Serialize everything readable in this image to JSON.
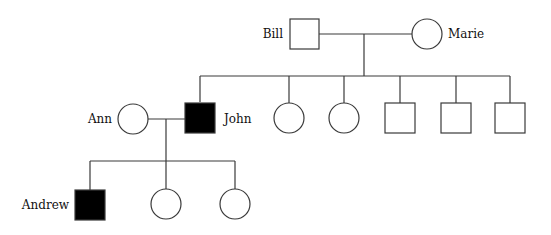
{
  "diagram": {
    "type": "pedigree",
    "individuals": [
      {
        "id": "bill",
        "name": "Bill",
        "sex": "male",
        "affected": false,
        "generation": 1
      },
      {
        "id": "marie",
        "name": "Marie",
        "sex": "female",
        "affected": false,
        "generation": 1
      },
      {
        "id": "ann",
        "name": "Ann",
        "sex": "female",
        "affected": false,
        "generation": 2
      },
      {
        "id": "john",
        "name": "John",
        "sex": "male",
        "affected": true,
        "generation": 2
      },
      {
        "id": "sib2",
        "name": "",
        "sex": "female",
        "affected": false,
        "generation": 2
      },
      {
        "id": "sib3",
        "name": "",
        "sex": "female",
        "affected": false,
        "generation": 2
      },
      {
        "id": "sib4",
        "name": "",
        "sex": "male",
        "affected": false,
        "generation": 2
      },
      {
        "id": "sib5",
        "name": "",
        "sex": "male",
        "affected": false,
        "generation": 2
      },
      {
        "id": "sib6",
        "name": "",
        "sex": "male",
        "affected": false,
        "generation": 2
      },
      {
        "id": "andrew",
        "name": "Andrew",
        "sex": "male",
        "affected": true,
        "generation": 3
      },
      {
        "id": "child2",
        "name": "",
        "sex": "female",
        "affected": false,
        "generation": 3
      },
      {
        "id": "child3",
        "name": "",
        "sex": "female",
        "affected": false,
        "generation": 3
      }
    ],
    "labels": {
      "bill": "Bill",
      "marie": "Marie",
      "ann": "Ann",
      "john": "John",
      "andrew": "Andrew"
    },
    "colors": {
      "line": "#3a3a3a",
      "affected_fill": "#000000",
      "unaffected_fill": "#ffffff"
    }
  }
}
